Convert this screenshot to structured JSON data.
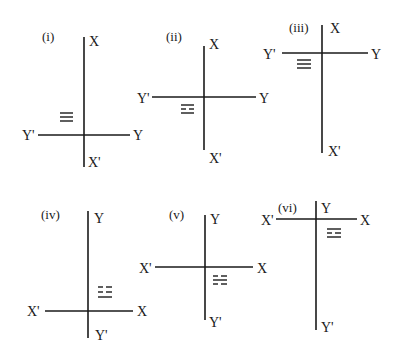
{
  "diagram": {
    "type": "coordinate-axes-orientation-set",
    "panels": [
      {
        "id": "i",
        "number_label": "(i)",
        "vertical_axis": {
          "top_label": "X",
          "bottom_label": "X'"
        },
        "horizontal_axis": {
          "left_label": "Y'",
          "right_label": "Y"
        },
        "hatch_symbol": "≡ (three lines)",
        "hatch_quadrant": "upper-left"
      },
      {
        "id": "ii",
        "number_label": "(ii)",
        "vertical_axis": {
          "top_label": "X",
          "bottom_label": "X'"
        },
        "horizontal_axis": {
          "left_label": "Y'",
          "right_label": "Y"
        },
        "hatch_symbol": "two rows of dashes",
        "hatch_quadrant": "lower-left"
      },
      {
        "id": "iii",
        "number_label": "(iii)",
        "vertical_axis": {
          "top_label": "X",
          "bottom_label": "X'"
        },
        "horizontal_axis": {
          "left_label": "Y'",
          "right_label": "Y"
        },
        "hatch_symbol": "≡ (three lines)",
        "hatch_quadrant": "lower-left"
      },
      {
        "id": "iv",
        "number_label": "(iv)",
        "vertical_axis": {
          "top_label": "Y",
          "bottom_label": "Y'"
        },
        "horizontal_axis": {
          "left_label": "X'",
          "right_label": "X"
        },
        "hatch_symbol": "two rows of dashes",
        "hatch_quadrant": "upper-right"
      },
      {
        "id": "v",
        "number_label": "(v)",
        "vertical_axis": {
          "top_label": "Y",
          "bottom_label": "Y'"
        },
        "horizontal_axis": {
          "left_label": "X'",
          "right_label": "X"
        },
        "hatch_symbol": "two rows of dashes",
        "hatch_quadrant": "lower-right"
      },
      {
        "id": "vi",
        "number_label": "(vi)",
        "vertical_axis": {
          "top_label": "Y",
          "bottom_label": "Y'"
        },
        "horizontal_axis": {
          "left_label": "X'",
          "right_label": "X"
        },
        "hatch_symbol": "two rows of dashes",
        "hatch_quadrant": "lower-right"
      }
    ]
  }
}
